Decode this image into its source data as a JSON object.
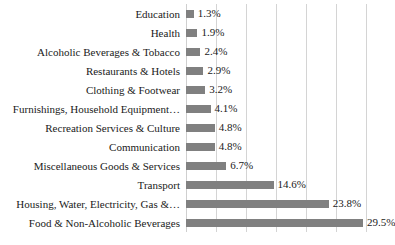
{
  "chart_data": {
    "type": "bar",
    "orientation": "horizontal",
    "title": "",
    "xlabel": "",
    "ylabel": "",
    "xlim": [
      0,
      30
    ],
    "grid": true,
    "gridlines": [
      0,
      5,
      10,
      15,
      20,
      25,
      30
    ],
    "legend": "none",
    "value_suffix": "%",
    "bar_color": "#808080",
    "gridline_color": "#d4d4d4",
    "categories": [
      "Education",
      "Health",
      "Alcoholic Beverages & Tobacco",
      "Restaurants & Hotels",
      "Clothing & Footwear",
      "Furnishings, Household Equipment…",
      "Recreation Services & Culture",
      "Communication",
      "Miscellaneous Goods & Services",
      "Transport",
      "Housing, Water, Electricity, Gas &…",
      "Food & Non-Alcoholic Beverages"
    ],
    "values": [
      1.3,
      1.9,
      2.4,
      2.9,
      3.2,
      4.1,
      4.8,
      4.8,
      6.7,
      14.6,
      23.8,
      29.5
    ],
    "data_labels": [
      "1.3%",
      "1.9%",
      "2.4%",
      "2.9%",
      "3.2%",
      "4.1%",
      "4.8%",
      "4.8%",
      "6.7%",
      "14.6%",
      "23.8%",
      "29.5%"
    ]
  }
}
